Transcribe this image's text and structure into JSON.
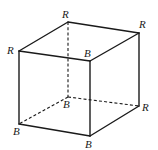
{
  "diagram": {
    "type": "cube",
    "vertices": {
      "top_back_left": {
        "label": "R",
        "x": 68,
        "y": 22,
        "label_x": 62,
        "label_y": 18
      },
      "top_back_right": {
        "label": "R",
        "x": 139,
        "y": 33,
        "label_x": 139,
        "label_y": 28
      },
      "top_front_left": {
        "label": "R",
        "x": 19,
        "y": 51,
        "label_x": 7,
        "label_y": 54
      },
      "top_front_right": {
        "label": "B",
        "x": 90,
        "y": 61,
        "label_x": 84,
        "label_y": 57
      },
      "bottom_back_left": {
        "label": "B",
        "x": 68,
        "y": 97,
        "label_x": 63,
        "label_y": 108
      },
      "bottom_back_right": {
        "label": "R",
        "x": 139,
        "y": 106,
        "label_x": 142,
        "label_y": 111
      },
      "bottom_front_left": {
        "label": "B",
        "x": 19,
        "y": 124,
        "label_x": 13,
        "label_y": 135
      },
      "bottom_front_right": {
        "label": "B",
        "x": 90,
        "y": 136,
        "label_x": 85,
        "label_y": 148
      }
    },
    "solid_edges": [
      [
        "top_back_left",
        "top_back_right"
      ],
      [
        "top_back_left",
        "top_front_left"
      ],
      [
        "top_back_right",
        "top_front_right"
      ],
      [
        "top_front_left",
        "top_front_right"
      ],
      [
        "top_front_left",
        "bottom_front_left"
      ],
      [
        "top_front_right",
        "bottom_front_right"
      ],
      [
        "top_back_right",
        "bottom_back_right"
      ],
      [
        "bottom_front_left",
        "bottom_front_right"
      ],
      [
        "bottom_front_right",
        "bottom_back_right"
      ]
    ],
    "dashed_edges": [
      [
        "top_back_left",
        "bottom_back_left"
      ],
      [
        "bottom_back_left",
        "bottom_front_left"
      ],
      [
        "bottom_back_left",
        "bottom_back_right"
      ]
    ],
    "colors": {
      "line": "#1a1a1a",
      "background": "#ffffff"
    }
  }
}
